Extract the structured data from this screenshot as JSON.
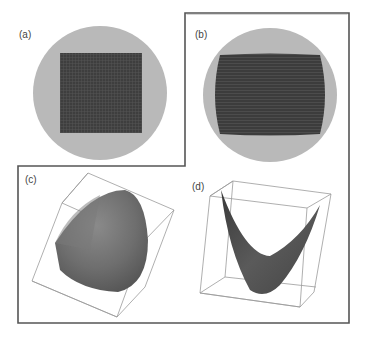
{
  "figure": {
    "panels": [
      {
        "id": "a",
        "label": "(a)",
        "description": "square grid pattern inside circular disk"
      },
      {
        "id": "b",
        "label": "(b)",
        "description": "barrel-shaped grid pattern inside circular disk"
      },
      {
        "id": "c",
        "label": "(c)",
        "description": "convex 3D surface inside bounding box"
      },
      {
        "id": "d",
        "label": "(d)",
        "description": "saddle-shaped 3D surface inside bounding box"
      }
    ],
    "colors": {
      "disk": "#b9b9b9",
      "grid": "#3f3f3f",
      "surface": "#6d6d6d",
      "frame": "#555555",
      "box_lines": "#9a9a9a"
    }
  }
}
